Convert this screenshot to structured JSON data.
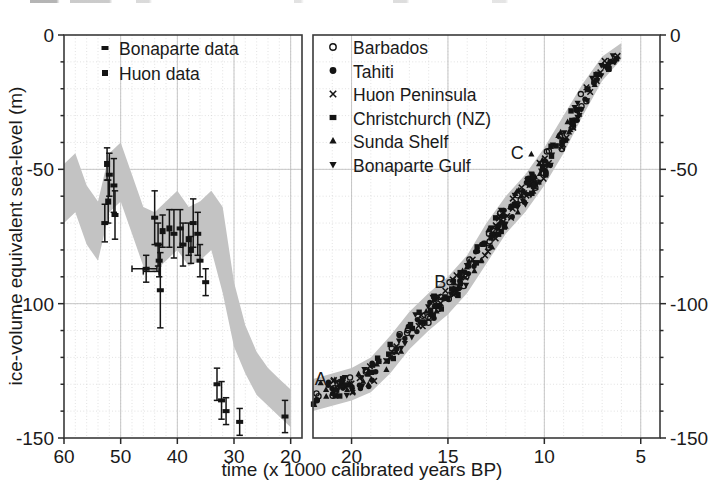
{
  "figure": {
    "axis_x_title": "time (x 1000 calibrated years BP)",
    "axis_y_title": "ice-volume equivalent sea-level (m)"
  },
  "left_panel": {
    "name": "left-panel",
    "x_ticks": [
      "60",
      "50",
      "40",
      "30",
      "20"
    ],
    "y_ticks": [
      "0",
      "-50",
      "-100",
      "-150"
    ],
    "legend": [
      {
        "marker": "bonaparte-tick-marker",
        "label": "Bonaparte data"
      },
      {
        "marker": "huon-square-marker",
        "label": "Huon data"
      }
    ]
  },
  "right_panel": {
    "name": "right-panel",
    "x_ticks": [
      "20",
      "15",
      "10",
      "5"
    ],
    "y_ticks": [
      "0",
      "-50",
      "-100",
      "-150"
    ],
    "legend": [
      {
        "marker": "open-circle-marker",
        "label": "Barbados"
      },
      {
        "marker": "filled-circle-marker",
        "label": "Tahiti"
      },
      {
        "marker": "cross-marker",
        "label": "Huon Peninsula"
      },
      {
        "marker": "filled-square-marker",
        "label": "Christchurch (NZ)"
      },
      {
        "marker": "triangle-up-marker",
        "label": "Sunda Shelf"
      },
      {
        "marker": "triangle-down-marker",
        "label": "Bonaparte Gulf"
      }
    ],
    "annotations": [
      {
        "name": "annotation-a",
        "label": "A"
      },
      {
        "name": "annotation-b",
        "label": "B"
      },
      {
        "name": "annotation-c",
        "label": "C"
      }
    ]
  },
  "chart_data": {
    "type": "line",
    "title": "",
    "xlabel": "time (x 1000 calibrated years BP)",
    "ylabel": "ice-volume equivalent sea-level (m)",
    "grid": true,
    "legend_position": "inside-top",
    "panels": [
      {
        "name": "left-panel",
        "xlim": [
          60,
          18
        ],
        "xlim_display_reversed": true,
        "ylim": [
          -150,
          0
        ],
        "xticks": [
          60,
          50,
          40,
          30,
          20
        ],
        "yticks": [
          0,
          -50,
          -100,
          -150
        ],
        "uncertainty_band": {
          "name": "sea-level-envelope",
          "x": [
            60,
            58,
            56,
            54,
            52,
            50,
            48,
            46,
            44,
            42,
            40,
            38,
            36,
            34,
            32,
            30,
            28,
            26,
            24,
            22,
            20
          ],
          "y_upper": [
            -48,
            -44,
            -56,
            -62,
            -44,
            -40,
            -52,
            -64,
            -66,
            -62,
            -58,
            -64,
            -62,
            -58,
            -64,
            -92,
            -108,
            -118,
            -124,
            -128,
            -132
          ],
          "y_lower": [
            -70,
            -66,
            -78,
            -84,
            -66,
            -62,
            -74,
            -86,
            -88,
            -84,
            -80,
            -86,
            -84,
            -80,
            -96,
            -116,
            -126,
            -134,
            -138,
            -142,
            -146
          ]
        },
        "series": [
          {
            "name": "Bonaparte data",
            "marker": "tick",
            "points": [
              {
                "x": 52.0,
                "y": -52,
                "yerr": 8
              },
              {
                "x": 51.2,
                "y": -56,
                "yerr": 10
              },
              {
                "x": 51.0,
                "y": -67,
                "yerr": 9
              },
              {
                "x": 52.8,
                "y": -70,
                "yerr": 7
              },
              {
                "x": 44.0,
                "y": -68,
                "yerr": 10
              },
              {
                "x": 43.4,
                "y": -78,
                "yerr": 8
              },
              {
                "x": 43.2,
                "y": -84,
                "yerr": 6
              },
              {
                "x": 45.5,
                "y": -87,
                "yerr": 5
              },
              {
                "x": 43.0,
                "y": -95,
                "yerr": 14
              },
              {
                "x": 40.6,
                "y": -74,
                "yerr": 9
              },
              {
                "x": 39.5,
                "y": -72,
                "yerr": 7
              },
              {
                "x": 39.0,
                "y": -78,
                "yerr": 8
              },
              {
                "x": 37.2,
                "y": -70,
                "yerr": 9
              },
              {
                "x": 36.4,
                "y": -74,
                "yerr": 8
              },
              {
                "x": 36.0,
                "y": -84,
                "yerr": 6
              },
              {
                "x": 35.0,
                "y": -92,
                "yerr": 5
              },
              {
                "x": 33.0,
                "y": -130,
                "yerr": 6
              },
              {
                "x": 32.2,
                "y": -136,
                "yerr": 7
              },
              {
                "x": 31.4,
                "y": -140,
                "yerr": 5
              },
              {
                "x": 29.0,
                "y": -144,
                "yerr": 5
              },
              {
                "x": 21.0,
                "y": -142,
                "yerr": 6
              }
            ]
          },
          {
            "name": "Huon data",
            "marker": "square",
            "points": [
              {
                "x": 52.4,
                "y": -48,
                "yerr": 6
              },
              {
                "x": 52.2,
                "y": -62,
                "yerr": 8
              },
              {
                "x": 42.6,
                "y": -73,
                "yerr": 6
              },
              {
                "x": 41.4,
                "y": -72,
                "yerr": 7
              },
              {
                "x": 38.0,
                "y": -76,
                "yerr": 6
              },
              {
                "x": 37.6,
                "y": -80,
                "yerr": 5
              }
            ]
          }
        ]
      },
      {
        "name": "right-panel",
        "xlim": [
          22,
          4
        ],
        "xlim_display_reversed": true,
        "ylim": [
          -150,
          0
        ],
        "xticks": [
          20,
          15,
          10,
          5
        ],
        "yticks": [
          0,
          -50,
          -100,
          -150
        ],
        "uncertainty_band": {
          "name": "sea-level-envelope",
          "x": [
            22,
            21,
            20,
            19,
            18,
            17,
            16,
            15,
            14,
            13,
            12,
            11,
            10,
            9,
            8,
            7,
            6
          ],
          "y_upper": [
            -128,
            -126,
            -124,
            -120,
            -112,
            -103,
            -96,
            -90,
            -82,
            -70,
            -60,
            -52,
            -42,
            -30,
            -18,
            -8,
            -3
          ],
          "y_lower": [
            -140,
            -138,
            -136,
            -133,
            -126,
            -117,
            -110,
            -104,
            -96,
            -85,
            -74,
            -66,
            -56,
            -44,
            -30,
            -17,
            -9
          ]
        },
        "series": [
          {
            "name": "Barbados",
            "marker": "open-circle"
          },
          {
            "name": "Tahiti",
            "marker": "filled-circle"
          },
          {
            "name": "Huon Peninsula",
            "marker": "cross"
          },
          {
            "name": "Christchurch (NZ)",
            "marker": "filled-square"
          },
          {
            "name": "Sunda Shelf",
            "marker": "triangle-up"
          },
          {
            "name": "Bonaparte Gulf",
            "marker": "triangle-down"
          }
        ],
        "annotations": [
          {
            "label": "A",
            "x": 21.6,
            "y": -128,
            "note": "meltwater pulse 1A region marker"
          },
          {
            "label": "B",
            "x": 15.4,
            "y": -92,
            "note": "meltwater pulse 1B region marker"
          },
          {
            "label": "C",
            "x": 11.4,
            "y": -44,
            "note": "meltwater pulse 1C region marker"
          }
        ]
      }
    ]
  }
}
